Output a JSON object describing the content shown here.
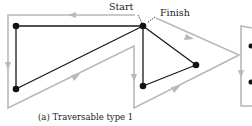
{
  "figure": {
    "caption": "(a) Traversable type 1",
    "labels": {
      "start": "Start",
      "finish": "Finish"
    },
    "colors": {
      "edge": "#1a1a1a",
      "path": "#b8b8b8",
      "node": "#111111",
      "text": "#222222"
    },
    "nodes": [
      {
        "id": "A",
        "x": 16,
        "y": 26
      },
      {
        "id": "B",
        "x": 143,
        "y": 26
      },
      {
        "id": "C",
        "x": 16,
        "y": 89
      },
      {
        "id": "D",
        "x": 196,
        "y": 65
      },
      {
        "id": "E",
        "x": 143,
        "y": 86
      }
    ],
    "edges": [
      [
        "A",
        "B"
      ],
      [
        "A",
        "C"
      ],
      [
        "C",
        "B"
      ],
      [
        "B",
        "E"
      ],
      [
        "B",
        "D"
      ],
      [
        "E",
        "D"
      ]
    ],
    "partial_next_figure": {
      "visible": true
    }
  }
}
